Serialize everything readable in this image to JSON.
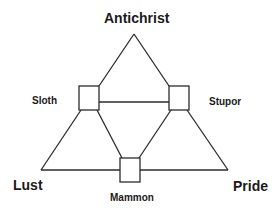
{
  "diagram": {
    "nodes": {
      "top": "Antichrist",
      "upper_left": "Sloth",
      "upper_right": "Stupor",
      "bottom_left": "Lust",
      "bottom_right": "Pride",
      "bottom_center": "Mammon"
    },
    "edges": [
      [
        "Antichrist",
        "Sloth"
      ],
      [
        "Antichrist",
        "Stupor"
      ],
      [
        "Sloth",
        "Stupor"
      ],
      [
        "Sloth",
        "Lust"
      ],
      [
        "Sloth",
        "Mammon"
      ],
      [
        "Stupor",
        "Mammon"
      ],
      [
        "Stupor",
        "Pride"
      ],
      [
        "Lust",
        "Mammon"
      ],
      [
        "Mammon",
        "Pride"
      ]
    ],
    "line_color": "#2b2b2b"
  }
}
